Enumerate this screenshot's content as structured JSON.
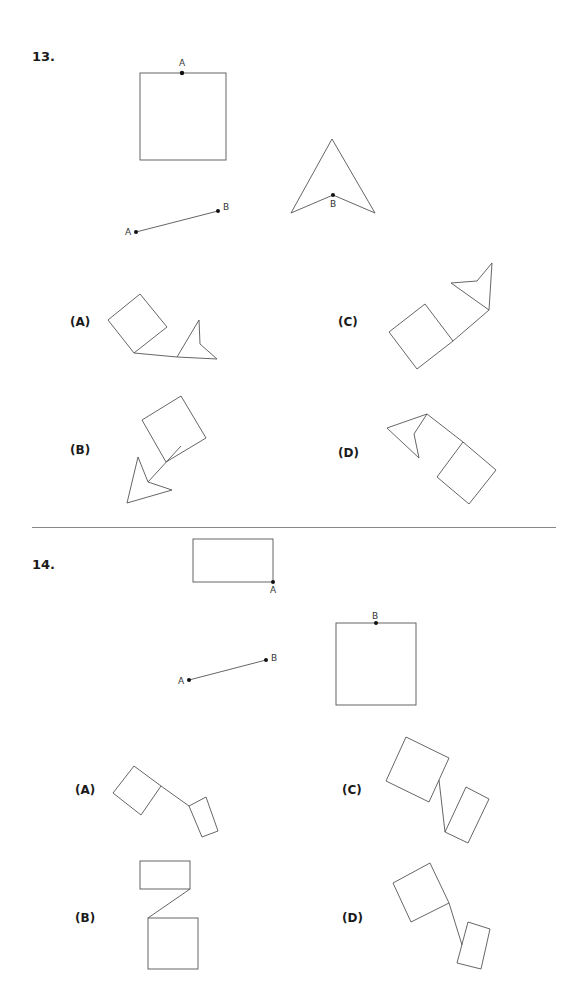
{
  "q13": {
    "number": "13.",
    "labels": {
      "square_point": "A",
      "segment_start": "A",
      "segment_end": "B",
      "arrow_point": "B"
    },
    "options": [
      {
        "key": "A",
        "label": "(A)"
      },
      {
        "key": "B",
        "label": "(B)"
      },
      {
        "key": "C",
        "label": "(C)"
      },
      {
        "key": "D",
        "label": "(D)"
      }
    ]
  },
  "q14": {
    "number": "14.",
    "labels": {
      "rect_point": "A",
      "segment_start": "A",
      "segment_end": "B",
      "square_point": "B"
    },
    "options": [
      {
        "key": "A",
        "label": "(A)"
      },
      {
        "key": "B",
        "label": "(B)"
      },
      {
        "key": "C",
        "label": "(C)"
      },
      {
        "key": "D",
        "label": "(D)"
      }
    ]
  }
}
